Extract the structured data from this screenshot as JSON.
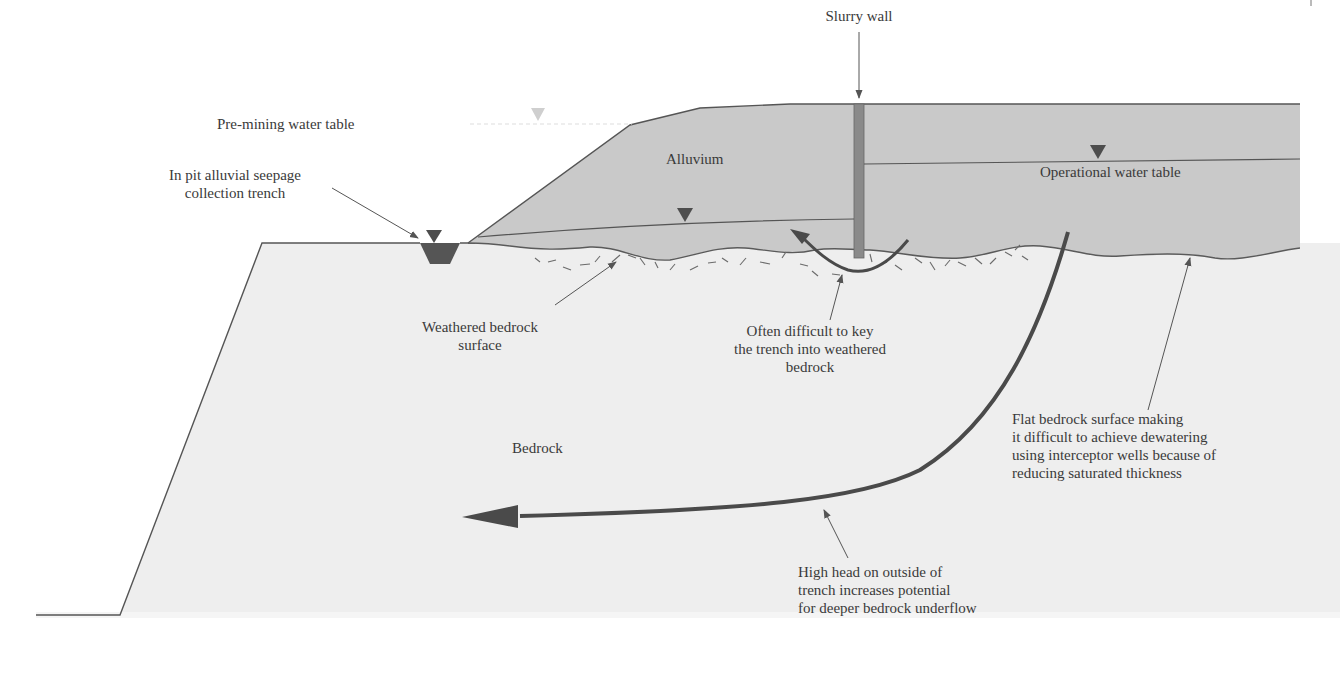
{
  "diagram": {
    "type": "geologic cross-section",
    "colors": {
      "alluvium_fill": "#c9c9c9",
      "bedrock_fill": "#eeeeee",
      "outline": "#555555",
      "slurry_wall": "#8a8a8a",
      "arrow": "#4a4a4a",
      "water_marker": "#4d4d4d",
      "premining_marker": "#cfcfcf",
      "text": "#3a3a3a"
    },
    "labels": {
      "slurry_wall": "Slurry wall",
      "premining_water_table": "Pre-mining water table",
      "alluvium": "Alluvium",
      "operational_water_table": "Operational water table",
      "seepage_trench": "In pit alluvial seepage\ncollection trench",
      "weathered_bedrock": "Weathered bedrock\nsurface",
      "key_trench": "Often difficult to key\nthe trench into weathered\nbedrock",
      "flat_bedrock": "Flat bedrock surface making\nit difficult to achieve dewatering\nusing interceptor wells because of\nreducing saturated thickness",
      "bedrock": "Bedrock",
      "high_head": "High head on outside of\ntrench increases potential\nfor deeper bedrock underflow"
    }
  }
}
